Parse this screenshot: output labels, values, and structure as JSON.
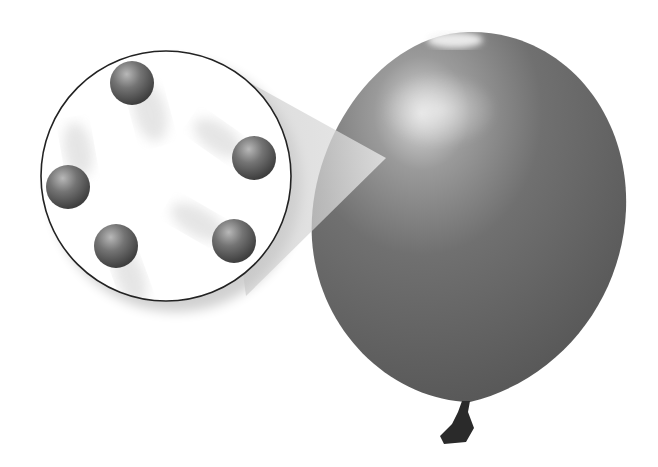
{
  "diagram": {
    "title": "",
    "balloon": {
      "color": "#6e6e6e",
      "highlight": "#d8d8d8",
      "knot_color": "#2a2a2a"
    },
    "inset": {
      "border_color": "#222222",
      "fill": "#ffffff"
    },
    "particles": [
      {
        "cx": 132,
        "cy": 83
      },
      {
        "cx": 254,
        "cy": 158
      },
      {
        "cx": 68,
        "cy": 187
      },
      {
        "cx": 116,
        "cy": 246
      },
      {
        "cx": 234,
        "cy": 241
      }
    ],
    "particle_color": "#6a6a6a"
  }
}
